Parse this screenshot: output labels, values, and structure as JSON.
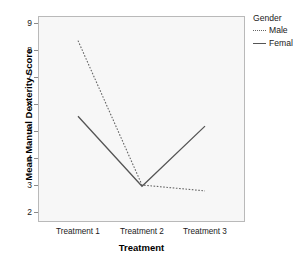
{
  "chart_data": {
    "type": "line",
    "title": "",
    "xlabel": "Treatment",
    "ylabel": "Mean Manual Dexterity Score",
    "categories": [
      "Treatment 1",
      "Treatment 2",
      "Treatment 3"
    ],
    "series": [
      {
        "name": "Male",
        "values": [
          8.35,
          3.0,
          2.78
        ],
        "style": "dotted",
        "color": "#666666"
      },
      {
        "name": "Femal",
        "values": [
          5.55,
          2.95,
          5.18
        ],
        "style": "solid",
        "color": "#555555"
      }
    ],
    "ylim": [
      1.7,
      9.35
    ],
    "yticks": [
      2,
      3,
      4,
      5,
      6,
      7,
      8,
      9
    ],
    "ytick_labels": [
      "2",
      "3",
      "4",
      "5",
      "6",
      "7",
      "8",
      "9"
    ],
    "grid": false,
    "legend_position": "top-right",
    "legend_title": "Gender",
    "plot_background": "#f7f7f7",
    "frame_color": "#b9b9b9"
  },
  "legend": {
    "title": "Gender",
    "entries": [
      {
        "label": "Male",
        "style": "dotted"
      },
      {
        "label": "Femal",
        "style": "solid"
      }
    ]
  },
  "axes": {
    "x_title": "Treatment",
    "y_title": "Mean Manual Dexterity Score",
    "x_labels": [
      "Treatment 1",
      "Treatment 2",
      "Treatment 3"
    ],
    "y_labels": [
      "9",
      "8",
      "7",
      "6",
      "5",
      "4",
      "3",
      "2"
    ]
  }
}
